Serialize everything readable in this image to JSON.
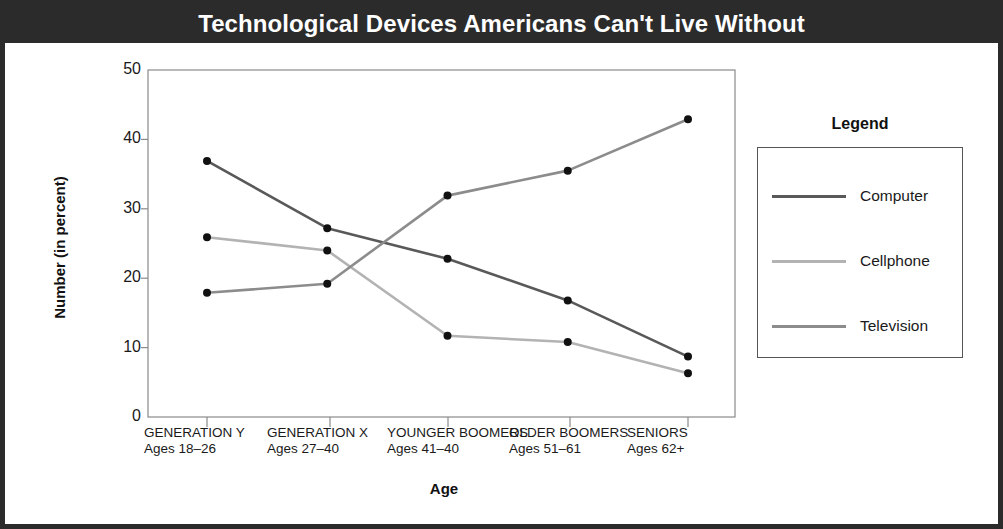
{
  "header": {
    "title": "Technological Devices Americans Can't Live Without"
  },
  "legend": {
    "title": "Legend",
    "entries": [
      {
        "label": "Computer",
        "color": "#595959"
      },
      {
        "label": "Cellphone",
        "color": "#b3b3b3"
      },
      {
        "label": "Television",
        "color": "#8c8c8c"
      }
    ]
  },
  "axes": {
    "y_title": "Number (in percent)",
    "x_title": "Age",
    "y_ticks": [
      "0",
      "10",
      "20",
      "30",
      "40",
      "50"
    ],
    "x_categories": [
      {
        "name": "GENERATION Y",
        "ages": "Ages 18–26"
      },
      {
        "name": "GENERATION X",
        "ages": "Ages 27–40"
      },
      {
        "name": "YOUNGER BOOMERS",
        "ages": "Ages 41–40"
      },
      {
        "name": "OLDER BOOMERS",
        "ages": "Ages 51–61"
      },
      {
        "name": "SENIORS",
        "ages": "Ages 62+"
      }
    ]
  },
  "chart_data": {
    "type": "line",
    "title": "Technological Devices Americans Can't Live Without",
    "xlabel": "Age",
    "ylabel": "Number (in percent)",
    "ylim": [
      0,
      50
    ],
    "ytick_step": 10,
    "grid": false,
    "legend_position": "right",
    "categories": [
      "GENERATION Y (Ages 18–26)",
      "GENERATION X (Ages 27–40)",
      "YOUNGER BOOMERS (Ages 41–40)",
      "OLDER BOOMERS (Ages 51–61)",
      "SENIORS (Ages 62+)"
    ],
    "series": [
      {
        "name": "Computer",
        "color": "#595959",
        "values": [
          36.9,
          27.2,
          22.8,
          16.8,
          8.7
        ]
      },
      {
        "name": "Cellphone",
        "color": "#b3b3b3",
        "values": [
          25.9,
          24.0,
          11.7,
          10.8,
          6.3
        ]
      },
      {
        "name": "Television",
        "color": "#8c8c8c",
        "values": [
          17.9,
          19.2,
          31.9,
          35.5,
          42.9
        ]
      }
    ]
  }
}
